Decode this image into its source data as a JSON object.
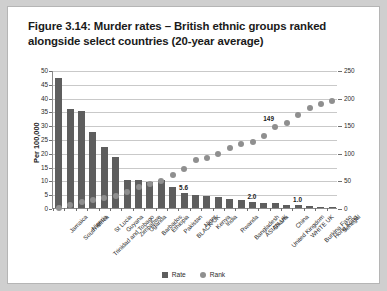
{
  "figure": {
    "title": "Figure 3.14: Murder rates – British ethnic groups ranked alongside select countries (20-year average)"
  },
  "legend": {
    "items": [
      {
        "label": "Rate",
        "marker": "square",
        "color": "#5e5e5e"
      },
      {
        "label": "Rank",
        "marker": "circle",
        "color": "#8f8f8f"
      }
    ]
  },
  "chart_data": {
    "type": "bar",
    "title": "Figure 3.14: Murder rates – British ethnic groups ranked alongside select countries (20-year average)",
    "xlabel": "",
    "ylabel": "Per 100,000",
    "y2label": "",
    "ylim": [
      0,
      50
    ],
    "y2lim": [
      0,
      250
    ],
    "yticks": [
      0,
      5,
      10,
      15,
      20,
      25,
      30,
      35,
      40,
      45,
      50
    ],
    "y2ticks": [
      0,
      50,
      100,
      150,
      200,
      250
    ],
    "grid": true,
    "legend_position": "bottom",
    "categories": [
      "Jamaica",
      "South Africa",
      "Nigeria",
      "Trinidad and Tobago",
      "St Lucia",
      "Guyana",
      "Zimbabwe",
      "Uganda",
      "Barbados",
      "Ethiopia",
      "Pakistan",
      "BLACK UK",
      "Niger",
      "Kenya",
      "India",
      "Rwanda",
      "Bangladesh",
      "ASIAN UK",
      "Ghana",
      "United Kingdom",
      "China",
      "WHITE UK",
      "Burkina Faso",
      "Hong Kong",
      "Senegal"
    ],
    "series": [
      {
        "name": "Rate",
        "axis": "left",
        "type": "bar",
        "color": "#5e5e5e",
        "values": [
          47.0,
          36.0,
          35.0,
          27.5,
          22.0,
          18.5,
          10.0,
          10.0,
          9.6,
          10.2,
          7.5,
          5.6,
          4.6,
          4.5,
          4.0,
          3.4,
          3.0,
          2.0,
          1.9,
          1.7,
          1.2,
          1.0,
          0.8,
          0.5,
          0.4
        ]
      },
      {
        "name": "Rank",
        "axis": "right",
        "type": "scatter",
        "color": "#8f8f8f",
        "values": [
          2,
          8,
          12,
          17,
          20,
          24,
          30,
          40,
          46,
          50,
          62,
          72,
          88,
          92,
          99,
          110,
          117,
          122,
          133,
          149,
          155,
          170,
          183,
          190,
          196
        ]
      }
    ],
    "point_labels": [
      {
        "category": "BLACK UK",
        "series": "Rate",
        "text": "5.6"
      },
      {
        "category": "ASIAN UK",
        "series": "Rate",
        "text": "2.0"
      },
      {
        "category": "WHITE UK",
        "series": "Rate",
        "text": "1.0"
      },
      {
        "category": "United Kingdom",
        "series": "Rank",
        "text": "149"
      }
    ]
  }
}
